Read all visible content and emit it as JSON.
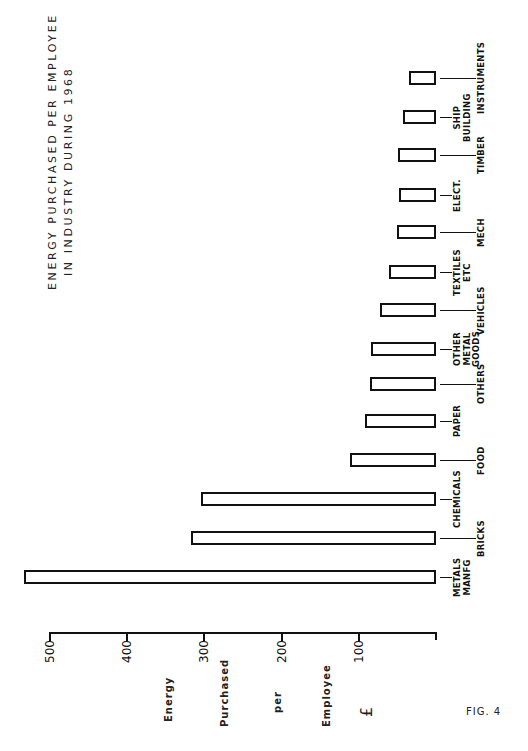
{
  "chart_data": {
    "type": "bar",
    "orientation": "horizontal-bars (page rotated 90°)",
    "title": "ENERGY PURCHASED PER EMPLOYEE",
    "subtitle": "IN INDUSTRY DURING 1968",
    "xlabel": "",
    "ylabel": "Energy Purchased per Employee £",
    "ylabel_words": [
      "Energy",
      "Purchased",
      "per",
      "Employee",
      "£"
    ],
    "ylim": [
      0,
      500
    ],
    "ticks": [
      100,
      200,
      300,
      400,
      500
    ],
    "grid": false,
    "legend": null,
    "categories": [
      "METALS MANFG",
      "BRICKS",
      "CHEMICALS",
      "FOOD",
      "PAPER",
      "OTHERS",
      "OTHER METAL GOODS",
      "VEHICLES",
      "TEXTILES ETC",
      "MECH",
      "ELECT.",
      "TIMBER",
      "SHIP BUILDING",
      "INSTRUMENTS"
    ],
    "values": [
      534,
      317,
      305,
      112,
      92,
      86,
      84,
      73,
      61,
      51,
      48,
      49,
      43,
      35
    ],
    "figure_label": "FIG. 4"
  },
  "title": {
    "line1": "ENERGY PURCHASED PER EMPLOYEE",
    "line2": "IN INDUSTRY DURING 1968"
  },
  "axis": {
    "ticks": [
      {
        "label": "500",
        "value": 500
      },
      {
        "label": "400",
        "value": 400
      },
      {
        "label": "300",
        "value": 300
      },
      {
        "label": "200",
        "value": 200
      },
      {
        "label": "100",
        "value": 100
      }
    ],
    "words": [
      "Energy",
      "Purchased",
      "per",
      "Employee",
      "£"
    ]
  },
  "bars": [
    {
      "label": "METALS\nMANFG",
      "value": 534,
      "y": 577,
      "leader": "short"
    },
    {
      "label": "BRICKS",
      "value": 317,
      "y": 538,
      "leader": "long"
    },
    {
      "label": "CHEMICALS",
      "value": 305,
      "y": 499,
      "leader": "short"
    },
    {
      "label": "FOOD",
      "value": 112,
      "y": 460,
      "leader": "long"
    },
    {
      "label": "PAPER",
      "value": 92,
      "y": 421,
      "leader": "short"
    },
    {
      "label": "OTHERS",
      "value": 86,
      "y": 384,
      "leader": "long"
    },
    {
      "label": "OTHER\nMETAL\nGOODS",
      "value": 84,
      "y": 349,
      "leader": "short"
    },
    {
      "label": "VEHICLES",
      "value": 73,
      "y": 310,
      "leader": "long"
    },
    {
      "label": "TEXTILES\nETC",
      "value": 61,
      "y": 272,
      "leader": "short"
    },
    {
      "label": "MECH",
      "value": 51,
      "y": 232,
      "leader": "long"
    },
    {
      "label": "ELECT.",
      "value": 48,
      "y": 195,
      "leader": "short"
    },
    {
      "label": "TIMBER",
      "value": 49,
      "y": 155,
      "leader": "long"
    },
    {
      "label": "SHIP\nBUILDING",
      "value": 43,
      "y": 117,
      "leader": "short"
    },
    {
      "label": "INSTRUMENTS",
      "value": 35,
      "y": 78,
      "leader": "long"
    }
  ],
  "figure_label": "FIG. 4"
}
